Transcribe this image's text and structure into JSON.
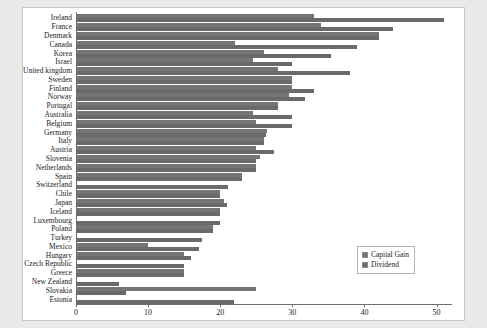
{
  "chart_data": {
    "type": "bar",
    "orientation": "horizontal",
    "title": "",
    "xlabel": "",
    "ylabel": "",
    "xlim": [
      0,
      52
    ],
    "xticks": [
      0,
      10,
      20,
      30,
      40,
      50
    ],
    "grid": false,
    "legend_position": "center-right",
    "categories": [
      "Ireland",
      "France",
      "Denmark",
      "Canada",
      "Korea",
      "Israel",
      "United kingdom",
      "Sweden",
      "Finland",
      "Norway",
      "Portugal",
      "Australia",
      "Belgium",
      "Germany",
      "Italy",
      "Austria",
      "Slovenia",
      "Netherlands",
      "Spain",
      "Switzerland",
      "Chile",
      "Japan",
      "Iceland",
      "Luxembourg",
      "Poland",
      "Turkey",
      "Mexico",
      "Hungary",
      "Czech Republic",
      "Greece",
      "New Zealand",
      "Slovakia",
      "Estonia"
    ],
    "series": [
      {
        "name": "Capital Gain",
        "color": "#757575",
        "values": [
          33,
          34,
          42,
          22,
          26,
          24.5,
          28,
          30,
          30,
          29.5,
          28,
          24.5,
          25,
          26.5,
          26,
          25,
          25.5,
          25,
          23,
          0,
          20,
          20.5,
          20,
          0,
          19,
          0,
          10,
          15,
          0,
          15,
          0,
          25,
          0
        ]
      },
      {
        "name": "Dividend",
        "color": "#6a6a6a",
        "values": [
          51,
          44,
          42,
          39,
          35.4,
          30,
          38,
          30,
          33,
          31.7,
          28,
          30,
          30,
          26.4,
          26,
          27.5,
          25,
          25,
          23,
          21.1,
          20,
          20.9,
          20,
          20,
          19,
          17.5,
          17.1,
          15.9,
          15,
          15,
          6,
          7,
          21.9
        ]
      }
    ]
  },
  "legend": {
    "entries": [
      {
        "label": "Capital Gain"
      },
      {
        "label": "Dividend"
      }
    ]
  }
}
